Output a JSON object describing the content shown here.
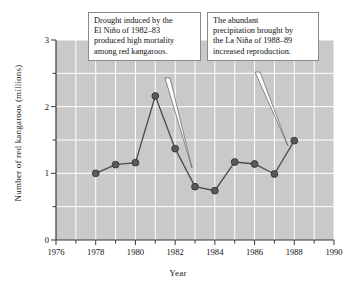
{
  "chart_data": {
    "type": "line",
    "title": "",
    "xlabel": "Year",
    "ylabel": "Number of red kangaroos (millions)",
    "xlim": [
      1976,
      1990
    ],
    "ylim": [
      0,
      3
    ],
    "xticks": [
      1976,
      1978,
      1980,
      1982,
      1984,
      1986,
      1988,
      1990
    ],
    "xtick_labels": [
      "1976",
      "1978",
      "1980",
      "1982",
      "1984",
      "1986",
      "1988",
      "1990"
    ],
    "xminor_step": 1,
    "yticks": [
      0,
      1,
      2,
      3
    ],
    "ytick_labels": [
      "0",
      "1",
      "2",
      "3"
    ],
    "yminor_step": 0.5,
    "grid": true,
    "legend": null,
    "plot_background": "#c9c9c9",
    "grid_color": "#ffffff",
    "series": [
      {
        "name": "Red kangaroo population",
        "marker": "circle",
        "marker_color": "#5a5a5a",
        "line_color": "#4a4a4a",
        "x": [
          1978,
          1979,
          1980,
          1981,
          1982,
          1983,
          1984,
          1985,
          1986,
          1987,
          1988
        ],
        "values": [
          1.0,
          1.13,
          1.16,
          2.16,
          1.37,
          0.8,
          0.74,
          1.17,
          1.14,
          0.99,
          1.49
        ]
      }
    ],
    "annotations": [
      {
        "id": "drought-callout",
        "lines": [
          "Drought induced by the",
          "El Niño of 1982–83",
          "produced high mortality",
          "among red kangaroos."
        ],
        "points_to_year": 1983
      },
      {
        "id": "precipitation-callout",
        "lines": [
          "The abundant",
          "precipitation brought by",
          "the La Niña of 1988–89",
          "increased reproduction."
        ],
        "points_to_year": 1988
      }
    ]
  },
  "axes": {
    "x_title": "Year",
    "y_title": "Number of red kangaroos (millions)"
  }
}
